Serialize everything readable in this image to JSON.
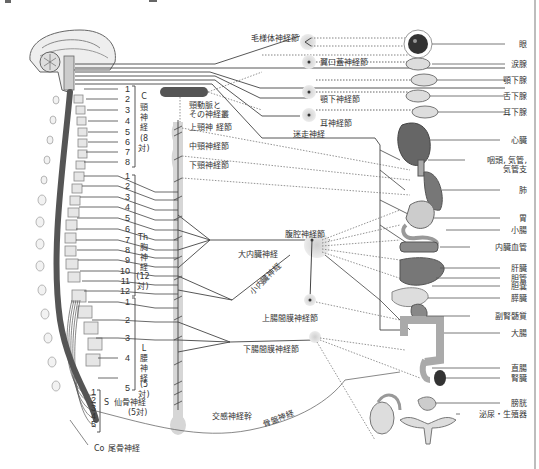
{
  "diagram": {
    "colors": {
      "line": "#444444",
      "dotted": "#666666",
      "ganglion_halo": "#d9d9d9",
      "organ": "#777777",
      "border": "#bdbdbd"
    },
    "spinal": {
      "cervical": {
        "code": "C",
        "name": "頸神経",
        "count": "(8対)",
        "numbers": [
          "1",
          "2",
          "3",
          "4",
          "5",
          "6",
          "7",
          "8"
        ]
      },
      "thoracic": {
        "code": "Th",
        "name": "胸神経",
        "count": "(12対)",
        "numbers": [
          "1",
          "2",
          "3",
          "4",
          "5",
          "6",
          "7",
          "8",
          "9",
          "10",
          "11",
          "12"
        ]
      },
      "lumbar": {
        "code": "L",
        "name": "腰神経",
        "count": "(5対)",
        "numbers": [
          "1",
          "2",
          "3",
          "4",
          "5"
        ]
      },
      "sacral": {
        "code": "S",
        "name": "仙骨神経",
        "count": "(5対)",
        "numbers": [
          "1",
          "2",
          "3",
          "4",
          "5"
        ]
      },
      "coccygeal": {
        "code": "Co",
        "name": "尾骨神経"
      }
    },
    "ganglia": {
      "ciliary": "毛様体神経節",
      "pterygopalatine": "翼口蓋神経節",
      "submandibular": "顎下神経節",
      "otic": "耳神経節",
      "carotid": "頸動脈と\nその神経叢",
      "carotid_line1": "頸動脈と",
      "carotid_line2": "その神経叢",
      "superior_cervical": "上頸神 経節",
      "middle_cervical": "中頸神経節",
      "inferior_cervical": "下頸神経節",
      "celiac": "腹腔神経節",
      "superior_mesenteric": "上腸間膜神経節",
      "inferior_mesenteric": "下腸間膜神経節"
    },
    "nerves": {
      "vagus": "迷走神経",
      "greater_splanchnic": "大内臓神経",
      "lesser_splanchnic": "小内臓神経",
      "sympathetic_trunk": "交感神経幹",
      "pelvic": "骨盤神経"
    },
    "organs": [
      {
        "id": "eye",
        "label": "眼"
      },
      {
        "id": "lacrimal",
        "label": "涙腺"
      },
      {
        "id": "submandibular_gland",
        "label": "顎下腺"
      },
      {
        "id": "sublingual_gland",
        "label": "舌下腺"
      },
      {
        "id": "parotid_gland",
        "label": "耳下腺"
      },
      {
        "id": "heart",
        "label": "心臓"
      },
      {
        "id": "larynx_line1",
        "label": "咽頭, 気管,"
      },
      {
        "id": "larynx_line2",
        "label": "気管支"
      },
      {
        "id": "lung",
        "label": "肺"
      },
      {
        "id": "stomach",
        "label": "胃"
      },
      {
        "id": "small_intestine",
        "label": "小腸"
      },
      {
        "id": "visceral_vessels",
        "label": "内臓血管"
      },
      {
        "id": "liver",
        "label": "肝臓"
      },
      {
        "id": "bile_duct",
        "label": "胆管"
      },
      {
        "id": "gallbladder",
        "label": "胆嚢"
      },
      {
        "id": "pancreas",
        "label": "膵臓"
      },
      {
        "id": "adrenal_medulla",
        "label": "副腎髄質"
      },
      {
        "id": "large_intestine",
        "label": "大腸"
      },
      {
        "id": "rectum",
        "label": "直腸"
      },
      {
        "id": "kidney",
        "label": "腎臓"
      },
      {
        "id": "bladder",
        "label": "膀胱"
      },
      {
        "id": "urogenital",
        "label": "泌尿・生殖器"
      }
    ]
  }
}
